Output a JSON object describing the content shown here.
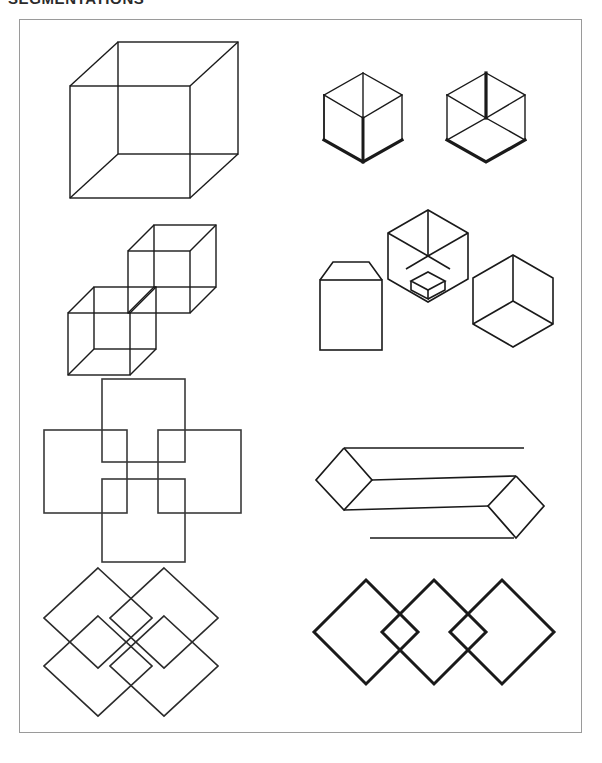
{
  "plate": {
    "title": "SEGMENTATIONS",
    "title_truncated_top": true,
    "border_color": "#9a9a9a",
    "background_color": "#ffffff",
    "stroke_color": "#1a1a1a",
    "panel": {
      "x": 19,
      "y": 19,
      "width": 563,
      "height": 714
    }
  },
  "figures": [
    {
      "id": "fig-1a",
      "position": "row-1-left",
      "name": "necker-cube-wireframe",
      "label": "",
      "description": "Single transparent wireframe Necker cube drawn in oblique projection with all twelve edges visible.",
      "stroke_width": 1.4,
      "shapes": [
        {
          "type": "polygon",
          "role": "front-face",
          "points": "30,58 150,58 150,170 30,170"
        },
        {
          "type": "polygon",
          "role": "back-face",
          "points": "78,14 198,14 198,126 78,126"
        },
        {
          "type": "line",
          "role": "connector-top-left",
          "x1": 30,
          "y1": 58,
          "x2": 78,
          "y2": 14
        },
        {
          "type": "line",
          "role": "connector-top-right",
          "x1": 150,
          "y1": 58,
          "x2": 198,
          "y2": 14
        },
        {
          "type": "line",
          "role": "connector-bottom-left",
          "x1": 30,
          "y1": 170,
          "x2": 78,
          "y2": 126
        },
        {
          "type": "line",
          "role": "connector-bottom-right",
          "x1": 150,
          "y1": 170,
          "x2": 198,
          "y2": 126
        }
      ]
    },
    {
      "id": "fig-1b",
      "position": "row-1-right",
      "name": "hexagon-cube-corner-pair",
      "label": "",
      "description": "Two small hexagons each containing a three-spoke Y junction; different subsets of edges are drawn with heavy stroke to bias the perceived cube corner.",
      "stroke_width": 1.4,
      "bold_stroke_width": 3.2,
      "hexagons": [
        {
          "role": "left-hexagon",
          "center": [
            55,
            58
          ],
          "radius": 45,
          "bold_edges": [
            "lower-left",
            "lower-right",
            "spoke-down"
          ],
          "thin_edges": [
            "upper-left",
            "upper-right",
            "top-left",
            "top-right",
            "spoke-upper-left",
            "spoke-upper-right"
          ]
        },
        {
          "role": "right-hexagon",
          "center": [
            178,
            58
          ],
          "radius": 45,
          "bold_edges": [
            "spoke-up",
            "lower-left",
            "lower-right"
          ],
          "thin_edges": [
            "upper-left",
            "upper-right",
            "top-left",
            "top-right",
            "spoke-lower-left",
            "spoke-lower-right"
          ]
        }
      ]
    },
    {
      "id": "fig-2a",
      "position": "row-2-left",
      "name": "two-linked-wireframe-cubes",
      "label": "",
      "description": "Two transparent wireframe cubes offset along the diagonal so that they interpenetrate at one shared corner region.",
      "stroke_width": 1.4,
      "cube_count": 2,
      "cube_size": 62,
      "cube_depth": 26,
      "cube_origins": [
        [
          28,
          78
        ],
        [
          88,
          18
        ]
      ]
    },
    {
      "id": "fig-2b",
      "position": "row-2-right",
      "name": "cube-corner-decomposition-triplet",
      "label": "",
      "description": "Three related solids: a square with a trapezoidal lid at left, a hexagonal cube-corner containing a small nested box at the bottom vertex in the middle, and a plain hexagonal cube-corner at right.",
      "stroke_width": 1.6,
      "parts": [
        {
          "role": "left-box-with-lid",
          "type": "square-plus-trapezoid",
          "square": "14,60 75,60 75,128 14,128",
          "lid": "14,60 26,44 63,44 75,60"
        },
        {
          "role": "center-hexagon-with-nested-box",
          "center": [
            120,
            48
          ],
          "radius": 46,
          "nested_box": {
            "role": "small-inner-cube",
            "position": "bottom-vertex"
          }
        },
        {
          "role": "right-hexagon-cube-corner",
          "center": [
            205,
            92
          ],
          "radius": 46,
          "spokes": [
            "up",
            "lower-left",
            "lower-right"
          ]
        }
      ]
    },
    {
      "id": "fig-3a",
      "position": "row-3-left",
      "name": "four-overlapping-squares-cross",
      "label": "",
      "description": "Four equal axis-aligned squares placed in a plus/cross configuration, each pair overlapping its neighbours to produce small square intersections at the centre.",
      "stroke_width": 1.6,
      "square_size": 83,
      "squares": [
        {
          "role": "top-square",
          "x": 68,
          "y": 6
        },
        {
          "role": "left-square",
          "x": 6,
          "y": 68
        },
        {
          "role": "right-square",
          "x": 130,
          "y": 68
        },
        {
          "role": "bottom-square",
          "x": 68,
          "y": 130
        }
      ]
    },
    {
      "id": "fig-3b",
      "position": "row-3-right",
      "name": "elongated-prism-with-detached-edges",
      "label": "",
      "description": "A long horizontal beam with diamond-shaped end caps; two of its long edges are drawn detached and displaced, floating above and below the body.",
      "stroke_width": 1.7,
      "parts": [
        {
          "role": "left-diamond-cap",
          "center": [
            32,
            50
          ],
          "half_width": 28,
          "half_height": 30
        },
        {
          "role": "right-diamond-cap",
          "center": [
            208,
            78
          ],
          "half_width": 28,
          "half_height": 30
        },
        {
          "role": "beam-upper-edge",
          "x1": 32,
          "y1": 20,
          "x2": 208,
          "y2": 48
        },
        {
          "role": "beam-lower-edge",
          "x1": 32,
          "y1": 80,
          "x2": 208,
          "y2": 108
        },
        {
          "role": "beam-mid-edge",
          "x1": 60,
          "y1": 50,
          "x2": 180,
          "y2": 50
        },
        {
          "role": "detached-top-line",
          "x1": 38,
          "y1": 16,
          "x2": 168,
          "y2": 16
        },
        {
          "role": "detached-bottom-line",
          "x1": 58,
          "y1": 112,
          "x2": 196,
          "y2": 112
        }
      ]
    },
    {
      "id": "fig-4a",
      "position": "row-4-left",
      "name": "four-overlapping-diamonds-pinwheel",
      "label": "",
      "description": "Four equal diamonds (45-degree rotated squares) arranged two-by-two; their mutual overlaps carve four small diamonds around the centre.",
      "stroke_width": 1.7,
      "diamond_half_width": 54,
      "diamond_half_height": 54,
      "diamond_centers": [
        [
          82,
          56
        ],
        [
          142,
          56
        ],
        [
          82,
          116
        ],
        [
          142,
          116
        ]
      ]
    },
    {
      "id": "fig-4b",
      "position": "row-4-right",
      "name": "three-diamonds-in-a-row",
      "label": "",
      "description": "Three heavy-stroked diamonds in a horizontal row; adjacent pairs overlap so that a small diamond appears in each gap.",
      "stroke_width": 3.0,
      "diamond_half_width": 52,
      "diamond_half_height": 52,
      "diamond_centers": [
        [
          60,
          62
        ],
        [
          128,
          62
        ],
        [
          196,
          62
        ]
      ]
    }
  ]
}
